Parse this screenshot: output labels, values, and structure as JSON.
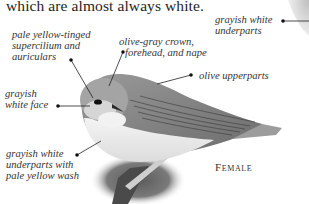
{
  "page": {
    "body_text": "which are almost always white."
  },
  "annotations": [
    {
      "id": "grayish-white-underparts-top",
      "lines": [
        "grayish white",
        "underparts"
      ]
    },
    {
      "id": "supercilium",
      "lines": [
        "pale yellow-tinged",
        "supercilium and",
        "auriculars"
      ]
    },
    {
      "id": "crown",
      "lines": [
        "olive-gray crown,",
        "forehead, and nape"
      ]
    },
    {
      "id": "upperparts",
      "lines": [
        "olive upperparts"
      ]
    },
    {
      "id": "face",
      "lines": [
        "grayish",
        "white face"
      ]
    },
    {
      "id": "underparts",
      "lines": [
        "grayish white",
        "underparts with",
        "pale yellow wash"
      ]
    }
  ],
  "caption": {
    "label": "Female"
  },
  "illustration": {
    "subject": "warbler-female",
    "colors": {
      "ink": "#222222",
      "bird_dark": "#555555",
      "bird_mid": "#8a8a8a",
      "bird_light": "#d8d8d8",
      "belly": "#efefef",
      "perch_shadow": "#6e6e6e"
    }
  }
}
